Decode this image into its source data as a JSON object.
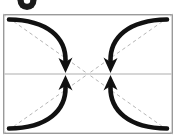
{
  "figure": {
    "name": "fold-instruction-diagram",
    "background_color": "#ffffff",
    "step_badge": {
      "icon": "step-number-badge-icon",
      "label": "",
      "fill_color": "#1a1a1a",
      "inner_color": "#ffffff",
      "center_x": 27,
      "center_y": 1,
      "radius": 9,
      "inner_radius": 3
    },
    "paper": {
      "name": "paper-rectangle",
      "x": 3,
      "y": 14,
      "width": 170,
      "height": 120,
      "stroke_color": "#9a9a9a",
      "fill_color": "#ffffff",
      "stroke_width": 1.4
    },
    "center_line": {
      "name": "horizontal-center-crease",
      "x1": 3,
      "y1": 74,
      "x2": 173,
      "y2": 74,
      "color": "#c9c9c9",
      "width": 1.6,
      "style": "solid"
    },
    "dashed_creases": [
      {
        "name": "diagonal-crease-top-left-to-center",
        "x1": 3,
        "y1": 14,
        "x2": 88,
        "y2": 74,
        "color": "#b6b6b6",
        "width": 1,
        "dash": "3.5 3"
      },
      {
        "name": "diagonal-crease-top-right-to-center",
        "x1": 173,
        "y1": 14,
        "x2": 88,
        "y2": 74,
        "color": "#b6b6b6",
        "width": 1,
        "dash": "3.5 3"
      },
      {
        "name": "diagonal-crease-bottom-left-to-center",
        "x1": 3,
        "y1": 134,
        "x2": 88,
        "y2": 74,
        "color": "#b6b6b6",
        "width": 1,
        "dash": "3.5 3"
      },
      {
        "name": "diagonal-crease-bottom-right-to-center",
        "x1": 173,
        "y1": 134,
        "x2": 88,
        "y2": 74,
        "color": "#b6b6b6",
        "width": 1,
        "dash": "3.5 3"
      }
    ],
    "arrows": [
      {
        "name": "fold-arrow-top-left",
        "direction": "down",
        "path": "M 10 20 C 52 22 68 42 66 62",
        "tip_x": 66,
        "tip_y": 72,
        "tip_angle": 100,
        "color": "#111111",
        "width": 4.6
      },
      {
        "name": "fold-arrow-top-right",
        "direction": "down",
        "path": "M 166 20 C 124 22 110 42 112 62",
        "tip_x": 112,
        "tip_y": 72,
        "tip_angle": 80,
        "color": "#111111",
        "width": 4.6
      },
      {
        "name": "fold-arrow-bottom-left",
        "direction": "up",
        "path": "M 10 128 C 52 126 68 106 66 86",
        "tip_x": 66,
        "tip_y": 76,
        "tip_angle": -100,
        "color": "#111111",
        "width": 4.6
      },
      {
        "name": "fold-arrow-bottom-right",
        "direction": "up",
        "path": "M 166 128 C 124 126 110 106 112 86",
        "tip_x": 112,
        "tip_y": 76,
        "tip_angle": -80,
        "color": "#111111",
        "width": 4.6
      }
    ]
  }
}
